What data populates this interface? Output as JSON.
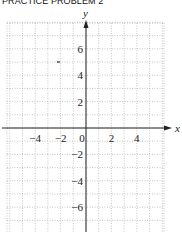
{
  "title": "PRACTICE PROBLEM 2",
  "chart_data": {
    "type": "scatter",
    "title": "PRACTICE PROBLEM 2",
    "xlabel": "x",
    "ylabel": "y",
    "xlim": [
      -6,
      6
    ],
    "ylim": [
      -8,
      8
    ],
    "grid": true,
    "grid_style": "dotted",
    "x_ticks": [
      {
        "value": -4,
        "label": "−4"
      },
      {
        "value": -2,
        "label": "−2"
      },
      {
        "value": 0,
        "label": "0"
      },
      {
        "value": 2,
        "label": "2"
      },
      {
        "value": 4,
        "label": "4"
      }
    ],
    "y_ticks": [
      {
        "value": 6,
        "label": "6"
      },
      {
        "value": 4,
        "label": "4"
      },
      {
        "value": 2,
        "label": "2"
      },
      {
        "value": -2,
        "label": "−2"
      },
      {
        "value": -4,
        "label": "−4"
      },
      {
        "value": -6,
        "label": "−6"
      }
    ],
    "points": [
      {
        "x": -3,
        "y": 5
      }
    ]
  }
}
